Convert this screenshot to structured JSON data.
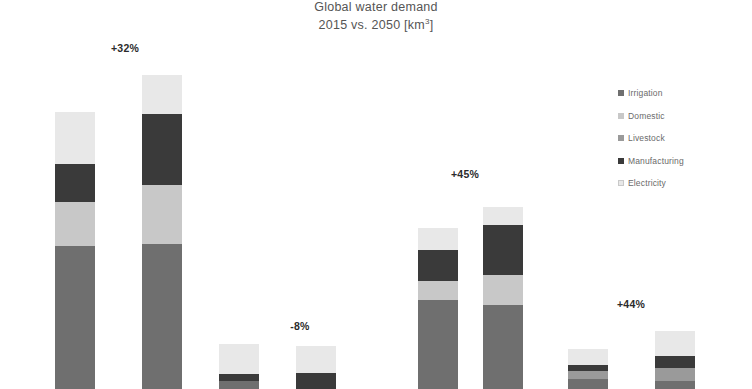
{
  "chart_data": {
    "type": "bar",
    "subtype": "stacked-bar-grouped",
    "title": "Global water demand",
    "subtitle": "2015 vs. 2050 [km³]",
    "title_line1": "Global water demand",
    "title_line2_prefix": "2015 vs. 2050 [km",
    "title_line2_sup": "3",
    "title_line2_suffix": "]",
    "unit": "km³",
    "xlabel": "",
    "ylabel": "",
    "grid": false,
    "legend_position": "right",
    "axis_visible": false,
    "note": "Bars are clipped by the bottom edge of the screenshot; no x-axis line, tick labels or y-axis are visible.",
    "categories": [
      "2015",
      "2050"
    ],
    "series": [
      {
        "name": "Irrigation",
        "color": "#6f6f6f"
      },
      {
        "name": "Domestic",
        "color": "#c8c8c8"
      },
      {
        "name": "Livestock",
        "color": "#9a9a9a"
      },
      {
        "name": "Manufacturing",
        "color": "#3a3a3a"
      },
      {
        "name": "Electricity",
        "color": "#e8e8e8"
      }
    ],
    "legend_entries": [
      "Irrigation",
      "Domestic",
      "Livestock",
      "Manufacturing",
      "Electricity"
    ],
    "groups": [
      {
        "name": "Group 1",
        "change_label": "+32%",
        "bars": [
          {
            "year": "2015",
            "segments": [
              {
                "name": "Irrigation",
                "px": 143
              },
              {
                "name": "Domestic",
                "px": 44
              },
              {
                "name": "Manufacturing",
                "px": 38
              },
              {
                "name": "Electricity",
                "px": 52
              }
            ]
          },
          {
            "year": "2050",
            "segments": [
              {
                "name": "Irrigation",
                "px": 145
              },
              {
                "name": "Domestic",
                "px": 59
              },
              {
                "name": "Manufacturing",
                "px": 71
              },
              {
                "name": "Electricity",
                "px": 39
              }
            ]
          }
        ]
      },
      {
        "name": "Group 2",
        "change_label": "-8%",
        "bars": [
          {
            "year": "2015",
            "segments": [
              {
                "name": "Irrigation",
                "px": 8
              },
              {
                "name": "Manufacturing",
                "px": 7
              },
              {
                "name": "Electricity",
                "px": 30
              }
            ]
          },
          {
            "year": "2050",
            "segments": [
              {
                "name": "Manufacturing",
                "px": 16
              },
              {
                "name": "Electricity",
                "px": 27
              }
            ]
          }
        ]
      },
      {
        "name": "Group 3",
        "change_label": "+45%",
        "bars": [
          {
            "year": "2015",
            "segments": [
              {
                "name": "Irrigation",
                "px": 89
              },
              {
                "name": "Domestic",
                "px": 19
              },
              {
                "name": "Manufacturing",
                "px": 31
              },
              {
                "name": "Electricity",
                "px": 22
              }
            ]
          },
          {
            "year": "2050",
            "segments": [
              {
                "name": "Irrigation",
                "px": 84
              },
              {
                "name": "Domestic",
                "px": 30
              },
              {
                "name": "Manufacturing",
                "px": 50
              },
              {
                "name": "Electricity",
                "px": 18
              }
            ]
          }
        ]
      },
      {
        "name": "Group 4",
        "change_label": "+44%",
        "bars": [
          {
            "year": "2015",
            "segments": [
              {
                "name": "Irrigation",
                "px": 10
              },
              {
                "name": "Livestock",
                "px": 8
              },
              {
                "name": "Manufacturing",
                "px": 6
              },
              {
                "name": "Electricity",
                "px": 16
              }
            ]
          },
          {
            "year": "2050",
            "segments": [
              {
                "name": "Irrigation",
                "px": 8
              },
              {
                "name": "Livestock",
                "px": 13
              },
              {
                "name": "Manufacturing",
                "px": 12
              },
              {
                "name": "Electricity",
                "px": 25
              }
            ]
          }
        ]
      }
    ]
  },
  "colors": {
    "irrigation": "#6f6f6f",
    "domestic": "#c8c8c8",
    "livestock": "#9a9a9a",
    "manufacturing": "#3a3a3a",
    "electricity": "#e8e8e8",
    "background": "#ffffff",
    "title_text": "#555555",
    "label_text": "#2b2b2b",
    "legend_text": "#6a6a6a"
  }
}
